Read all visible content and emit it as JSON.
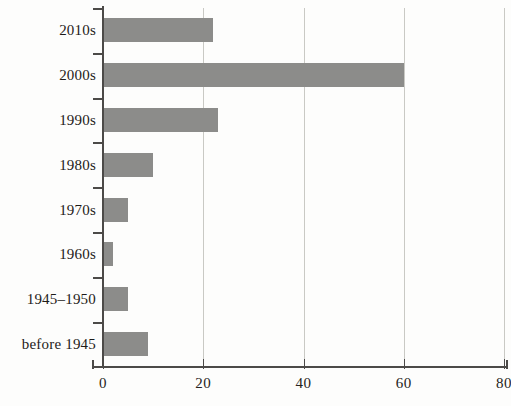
{
  "chart_data": {
    "type": "bar",
    "orientation": "horizontal",
    "title": "",
    "subtitle": "",
    "xlabel": "",
    "ylabel": "",
    "categories": [
      "2010s",
      "2000s",
      "1990s",
      "1980s",
      "1970s",
      "1960s",
      "1945–1950",
      "before 1945"
    ],
    "values": [
      22,
      60,
      23,
      10,
      5,
      2,
      5,
      9
    ],
    "xlim": [
      0,
      80
    ],
    "xticks": [
      0,
      20,
      40,
      60,
      80
    ],
    "xtick_labels": [
      "0",
      "20",
      "40",
      "60",
      "80"
    ],
    "grid": "vertical",
    "legend": null,
    "series": [
      {
        "name": "count",
        "values": [
          22,
          60,
          23,
          10,
          5,
          2,
          5,
          9
        ]
      }
    ],
    "colors": {
      "bar": "#8c8c8a",
      "axis": "#4c4a48",
      "gridline": "#c9c9c4",
      "text": "#1d1b19",
      "background": "#fdfdfc"
    }
  },
  "axis": {
    "x_tick_labels": [
      "0",
      "20",
      "40",
      "60",
      "80"
    ],
    "y_tick_labels": [
      "2010s",
      "2000s",
      "1990s",
      "1980s",
      "1970s",
      "1960s",
      "1945–1950",
      "before 1945"
    ]
  }
}
